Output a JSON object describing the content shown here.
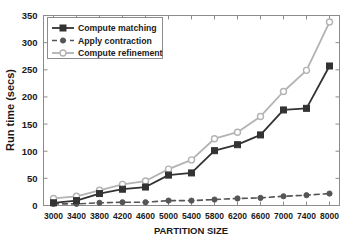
{
  "chart_data": {
    "type": "line",
    "title": "",
    "xlabel": "PARTITION SIZE",
    "ylabel": "Run time (secs)",
    "categories": [
      "3000",
      "3400",
      "3800",
      "4200",
      "4600",
      "5000",
      "5400",
      "5800",
      "6200",
      "6600",
      "7000",
      "7400",
      "8000"
    ],
    "ylim": [
      0,
      350
    ],
    "yticks": [
      "0",
      "50",
      "100",
      "150",
      "200",
      "250",
      "300",
      "350"
    ],
    "grid": false,
    "legend_position": "top-left",
    "series": [
      {
        "name": "Compute matching",
        "color": "#333333",
        "marker": "filled-square",
        "linestyle": "solid",
        "values": [
          5,
          9,
          22,
          30,
          34,
          56,
          60,
          101,
          112,
          130,
          176,
          179,
          257
        ]
      },
      {
        "name": "Apply contraction",
        "color": "#555555",
        "marker": "filled-circle",
        "linestyle": "dashed",
        "values": [
          3,
          3,
          5,
          6,
          6,
          9,
          9,
          11,
          13,
          14,
          17,
          19,
          22
        ]
      },
      {
        "name": "Compute refinement",
        "color": "#b3b3b3",
        "marker": "open-circle",
        "linestyle": "solid",
        "values": [
          13,
          17,
          28,
          39,
          45,
          67,
          84,
          123,
          135,
          164,
          210,
          249,
          338
        ]
      }
    ]
  },
  "legend": {
    "items": [
      {
        "label": "Compute matching"
      },
      {
        "label": "Apply contraction"
      },
      {
        "label": "Compute refinement"
      }
    ]
  }
}
